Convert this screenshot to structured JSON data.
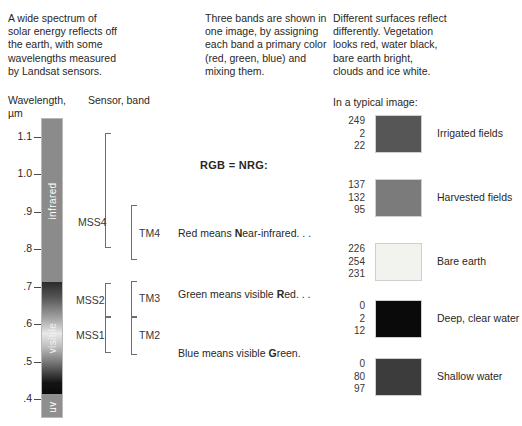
{
  "intro": {
    "left": "A wide spectrum of\nsolar energy reflects off\nthe earth, with some\nwavelengths measured\nby Landsat sensors.",
    "middle": "Three bands are shown in\none image, by assigning\neach band a primary color\n(red, green, blue) and\nmixing them.",
    "right": "Different surfaces reflect\ndifferently. Vegetation\nlooks red, water black,\nbare earth bright,\nclouds and ice white."
  },
  "headings": {
    "wavelength": "Wavelength,\nµm",
    "sensor": "Sensor, band",
    "typical_image": "In a typical image:"
  },
  "spectrum": {
    "axis_ticks": [
      {
        "label": "1.1",
        "value": 1.1
      },
      {
        "label": "1.0",
        "value": 1.0
      },
      {
        "label": ".9",
        "value": 0.9
      },
      {
        "label": ".8",
        "value": 0.8
      },
      {
        "label": ".7",
        "value": 0.7
      },
      {
        "label": ".6",
        "value": 0.6
      },
      {
        "label": ".5",
        "value": 0.5
      },
      {
        "label": ".4",
        "value": 0.4
      }
    ],
    "bands": [
      {
        "name": "infrared",
        "color": "#8b8b8b"
      },
      {
        "name": "visible",
        "color": "gradient"
      },
      {
        "name": "uv",
        "color": "#8f8f8f"
      }
    ]
  },
  "sensor_bands": [
    {
      "name": "MSS4"
    },
    {
      "name": "TM4"
    },
    {
      "name": "MSS2"
    },
    {
      "name": "TM3"
    },
    {
      "name": "MSS1"
    },
    {
      "name": "TM2"
    }
  ],
  "rgb_explainer": {
    "heading": "RGB = NRG:",
    "lines": [
      {
        "prefix": "Red means ",
        "bold": "N",
        "suffix": "ear-infrared. . ."
      },
      {
        "prefix": "Green means visible ",
        "bold": "R",
        "suffix": "ed. . ."
      },
      {
        "prefix": "Blue means visible ",
        "bold": "G",
        "suffix": "reen."
      }
    ]
  },
  "surface_samples": [
    {
      "label": "Irrigated fields",
      "r": 249,
      "g": 2,
      "b": 22,
      "swatch_hex": "#565656"
    },
    {
      "label": "Harvested fields",
      "r": 137,
      "g": 132,
      "b": 95,
      "swatch_hex": "#7b7b7b"
    },
    {
      "label": "Bare earth",
      "r": 226,
      "g": 254,
      "b": 231,
      "swatch_hex": "#f2f2ee"
    },
    {
      "label": "Deep, clear water",
      "r": 0,
      "g": 2,
      "b": 12,
      "swatch_hex": "#0a0a0a"
    },
    {
      "label": "Shallow water",
      "r": 0,
      "g": 80,
      "b": 97,
      "swatch_hex": "#3c3c3c"
    }
  ]
}
